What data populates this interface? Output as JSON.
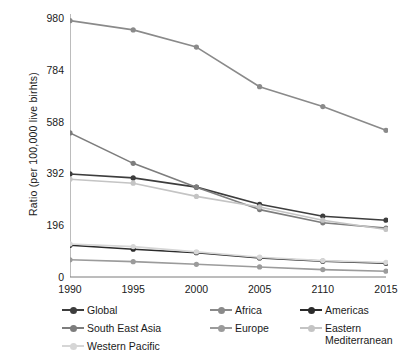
{
  "chart_data": {
    "type": "line",
    "title": "",
    "xlabel": "",
    "ylabel": "Ratio (per 100,000 live birhts)",
    "categories": [
      "1990",
      "1995",
      "2000",
      "2005",
      "2110",
      "2015"
    ],
    "x_tick_labels": [
      "1990",
      "1995",
      "2000",
      "2005",
      "2110",
      "2015"
    ],
    "y_tick_labels": [
      "0",
      "196",
      "392",
      "588",
      "784",
      "980"
    ],
    "y_ticks": [
      0,
      196,
      392,
      588,
      784,
      980
    ],
    "ylim": [
      0,
      980
    ],
    "grid": false,
    "legend_position": "bottom",
    "markers": "circle",
    "series": [
      {
        "name": "Global",
        "color": "#3d3d3d",
        "values": [
          390,
          375,
          340,
          275,
          230,
          215
        ]
      },
      {
        "name": "Africa",
        "color": "#8a8a8a",
        "values": [
          970,
          935,
          870,
          720,
          645,
          555
        ]
      },
      {
        "name": "Americas",
        "color": "#2b2b2b",
        "values": [
          120,
          105,
          92,
          72,
          60,
          52
        ]
      },
      {
        "name": "South East Asia",
        "color": "#7d7d7d",
        "values": [
          545,
          430,
          340,
          255,
          205,
          185
        ]
      },
      {
        "name": "Europe",
        "color": "#9b9b9b",
        "values": [
          65,
          58,
          48,
          38,
          28,
          22
        ]
      },
      {
        "name": "Eastern Mediterranean",
        "color": "#c4c4c4",
        "values": [
          370,
          355,
          305,
          265,
          215,
          180
        ]
      },
      {
        "name": "Western Pacific",
        "color": "#d6d6d6",
        "values": [
          125,
          115,
          95,
          75,
          62,
          55
        ]
      }
    ]
  },
  "legend": {
    "items": [
      {
        "label": "Global",
        "color": "#3d3d3d"
      },
      {
        "label": "Africa",
        "color": "#8a8a8a"
      },
      {
        "label": "Americas",
        "color": "#2b2b2b"
      },
      {
        "label": "South East Asia",
        "color": "#7d7d7d"
      },
      {
        "label": "Europe",
        "color": "#9b9b9b"
      },
      {
        "label": "Eastern\nMediterranean",
        "color": "#c4c4c4"
      },
      {
        "label": "Western Pacific",
        "color": "#d6d6d6"
      }
    ]
  },
  "axis": {
    "y_label": "Ratio (per 100,000 live birhts)",
    "axis_color": "#7a7a7a"
  }
}
